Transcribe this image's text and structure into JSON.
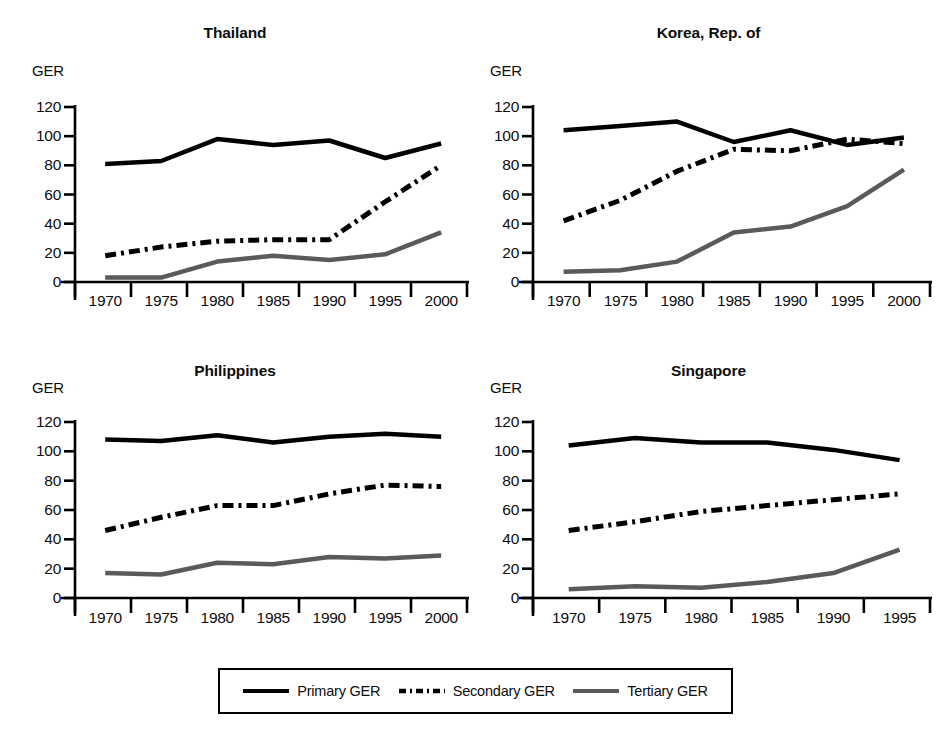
{
  "figure": {
    "background": "#ffffff",
    "line_colors": {
      "primary": "#000000",
      "secondary": "#000000",
      "tertiary": "#5a5a5a"
    }
  },
  "legend": {
    "position": "bottom-center",
    "entries": [
      {
        "label": "Primary GER",
        "style": "solid",
        "color": "#000000",
        "icon": "solid-line-icon"
      },
      {
        "label": "Secondary GER",
        "style": "dash-dot",
        "color": "#000000",
        "icon": "dashed-line-icon"
      },
      {
        "label": "Tertiary GER",
        "style": "solid-gray",
        "color": "#5a5a5a",
        "icon": "gray-line-icon"
      }
    ]
  },
  "chart_data": [
    {
      "type": "line",
      "title": "Thailand",
      "xlabel": "",
      "ylabel": "GER",
      "ylim": [
        0,
        120
      ],
      "yticks": [
        0,
        20,
        40,
        60,
        80,
        100,
        120
      ],
      "x": [
        1970,
        1975,
        1980,
        1985,
        1990,
        1995,
        2000
      ],
      "xticklabels": [
        "1970",
        "1975",
        "1980",
        "1985",
        "1990",
        "1995",
        "2000"
      ],
      "grid": false,
      "series": [
        {
          "name": "Primary GER",
          "values": [
            81,
            83,
            98,
            94,
            97,
            85,
            95
          ]
        },
        {
          "name": "Secondary GER",
          "values": [
            18,
            24,
            28,
            29,
            29,
            55,
            80
          ]
        },
        {
          "name": "Tertiary GER",
          "values": [
            3,
            3,
            14,
            18,
            15,
            19,
            34
          ]
        }
      ]
    },
    {
      "type": "line",
      "title": "Korea, Rep. of",
      "xlabel": "",
      "ylabel": "GER",
      "ylim": [
        0,
        120
      ],
      "yticks": [
        0,
        20,
        40,
        60,
        80,
        100,
        120
      ],
      "x": [
        1970,
        1975,
        1980,
        1985,
        1990,
        1995,
        2000
      ],
      "xticklabels": [
        "1970",
        "1975",
        "1980",
        "1985",
        "1990",
        "1995",
        "2000"
      ],
      "grid": false,
      "series": [
        {
          "name": "Primary GER",
          "values": [
            104,
            107,
            110,
            96,
            104,
            94,
            99
          ]
        },
        {
          "name": "Secondary GER",
          "values": [
            42,
            56,
            76,
            91,
            90,
            98,
            95
          ]
        },
        {
          "name": "Tertiary GER",
          "values": [
            7,
            8,
            14,
            34,
            38,
            52,
            77
          ]
        }
      ]
    },
    {
      "type": "line",
      "title": "Philippines",
      "xlabel": "",
      "ylabel": "GER",
      "ylim": [
        0,
        120
      ],
      "yticks": [
        0,
        20,
        40,
        60,
        80,
        100,
        120
      ],
      "x": [
        1970,
        1975,
        1980,
        1985,
        1990,
        1995,
        2000
      ],
      "xticklabels": [
        "1970",
        "1975",
        "1980",
        "1985",
        "1990",
        "1995",
        "2000"
      ],
      "grid": false,
      "series": [
        {
          "name": "Primary GER",
          "values": [
            108,
            107,
            111,
            106,
            110,
            112,
            110
          ]
        },
        {
          "name": "Secondary GER",
          "values": [
            46,
            55,
            63,
            63,
            71,
            77,
            76
          ]
        },
        {
          "name": "Tertiary GER",
          "values": [
            17,
            16,
            24,
            23,
            28,
            27,
            29
          ]
        }
      ]
    },
    {
      "type": "line",
      "title": "Singapore",
      "xlabel": "",
      "ylabel": "GER",
      "ylim": [
        0,
        120
      ],
      "yticks": [
        0,
        20,
        40,
        60,
        80,
        100,
        120
      ],
      "x": [
        1970,
        1975,
        1980,
        1985,
        1990,
        1995
      ],
      "xticklabels": [
        "1970",
        "1975",
        "1980",
        "1985",
        "1990",
        "1995"
      ],
      "grid": false,
      "series": [
        {
          "name": "Primary GER",
          "values": [
            104,
            109,
            106,
            106,
            101,
            94
          ]
        },
        {
          "name": "Secondary GER",
          "values": [
            46,
            52,
            59,
            63,
            67,
            71
          ]
        },
        {
          "name": "Tertiary GER",
          "values": [
            6,
            8,
            7,
            11,
            17,
            33
          ]
        }
      ]
    }
  ]
}
